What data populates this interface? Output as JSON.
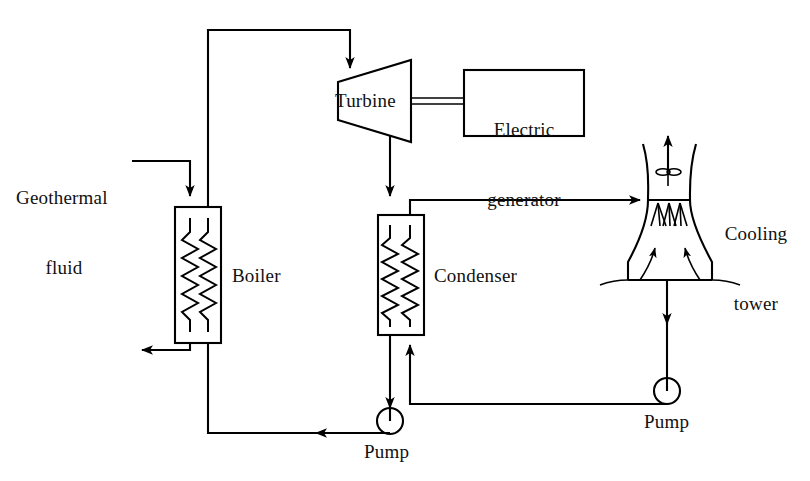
{
  "diagram": {
    "background_color": "#ffffff",
    "line_color": "#000000"
  },
  "labels": {
    "geothermal_fluid_line1": "Geothermal",
    "geothermal_fluid_line2": "fluid",
    "boiler": "Boiler",
    "turbine": "Turbine",
    "electric_generator_line1": "Electric",
    "electric_generator_line2": "generator",
    "condenser": "Condenser",
    "cooling_tower_line1": "Cooling",
    "cooling_tower_line2": "tower",
    "pump_left": "Pump",
    "pump_right": "Pump"
  },
  "components": [
    {
      "name": "boiler",
      "type": "heat-exchanger",
      "label": "Boiler"
    },
    {
      "name": "turbine",
      "type": "turbine",
      "label": "Turbine"
    },
    {
      "name": "electric-generator",
      "type": "box",
      "label": "Electric generator"
    },
    {
      "name": "condenser",
      "type": "heat-exchanger",
      "label": "Condenser"
    },
    {
      "name": "cooling-tower",
      "type": "hyperbolic-tower",
      "label": "Cooling tower"
    },
    {
      "name": "pump-working-fluid",
      "type": "pump",
      "label": "Pump"
    },
    {
      "name": "pump-cooling-water",
      "type": "pump",
      "label": "Pump"
    }
  ],
  "flows": [
    {
      "name": "geothermal-fluid-inlet",
      "from": "Geothermal fluid",
      "to": "Boiler",
      "direction": "down"
    },
    {
      "name": "geothermal-fluid-outlet",
      "from": "Boiler",
      "to": "reinjection",
      "direction": "left"
    },
    {
      "name": "boiler-to-turbine",
      "from": "Boiler",
      "to": "Turbine",
      "direction": "down"
    },
    {
      "name": "turbine-shaft",
      "from": "Turbine",
      "to": "Electric generator",
      "direction": "right"
    },
    {
      "name": "turbine-to-condenser",
      "from": "Turbine",
      "to": "Condenser",
      "direction": "down"
    },
    {
      "name": "condenser-to-pump",
      "from": "Condenser",
      "to": "Pump",
      "direction": "down"
    },
    {
      "name": "pump-to-boiler",
      "from": "Pump",
      "to": "Boiler",
      "direction": "left"
    },
    {
      "name": "condenser-to-cooling-tower",
      "from": "Condenser",
      "to": "Cooling tower",
      "direction": "right"
    },
    {
      "name": "cooling-tower-to-pump",
      "from": "Cooling tower",
      "to": "Pump",
      "direction": "down"
    },
    {
      "name": "pump-to-condenser",
      "from": "Pump",
      "to": "Condenser",
      "direction": "left-up"
    },
    {
      "name": "tower-air-exhaust",
      "from": "Cooling tower",
      "to": "atmosphere",
      "direction": "up"
    },
    {
      "name": "tower-air-intake-left",
      "from": "atmosphere",
      "to": "Cooling tower",
      "direction": "up-right"
    },
    {
      "name": "tower-air-intake-right",
      "from": "atmosphere",
      "to": "Cooling tower",
      "direction": "up-left"
    }
  ]
}
